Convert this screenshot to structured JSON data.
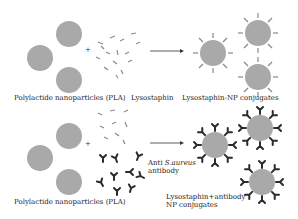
{
  "diagram": {
    "colors": {
      "particle": "#a9a9a9",
      "enzyme": "#8a8a8a",
      "antibody": "#2b2b2b",
      "arrow": "#333333",
      "text": "#222222"
    },
    "row1": {
      "plus": "+",
      "label_nanoparticles": "Polylactide nanoparticles (PLA)",
      "label_lysostaphin": "Lysostaphin",
      "label_conjugates": "Lysostaphin-NP conjugates"
    },
    "row2": {
      "plus": "+",
      "label_nanoparticles": "Polylactide nanoparticles (PLA)",
      "label_antibody_line1_prefix": "Anti ",
      "label_antibody_line1_italic": "S.aureus",
      "label_antibody_line2": "antibody",
      "label_conjugates_line1": "Lysostaphin+antibody",
      "label_conjugates_line2": "NP conjugates"
    }
  }
}
